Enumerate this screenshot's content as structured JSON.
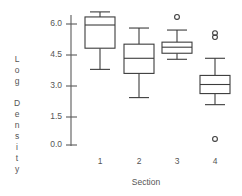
{
  "chart_data": {
    "type": "box",
    "title": "",
    "xlabel": "Section",
    "ylabel": "Log Density",
    "ylabel_lines": [
      "L",
      "o",
      "g",
      "",
      "D",
      "e",
      "n",
      "s",
      "i",
      "t",
      "y"
    ],
    "categories": [
      "1",
      "2",
      "3",
      "4"
    ],
    "ytick_labels": [
      "6.0",
      "4.5",
      "3.0",
      "1.5",
      "0.0"
    ],
    "ytick_values": [
      6.0,
      4.5,
      3.0,
      1.5,
      0.0
    ],
    "ylim": [
      -0.1,
      6.8
    ],
    "grid": false,
    "legend": null,
    "boxes": [
      {
        "category": "1",
        "whisker_low": 3.75,
        "q1": 4.8,
        "median": 5.95,
        "q3": 6.35,
        "whisker_high": 6.6,
        "outliers": []
      },
      {
        "category": "2",
        "whisker_low": 2.35,
        "q1": 3.55,
        "median": 4.3,
        "q3": 5.0,
        "whisker_high": 5.8,
        "outliers": []
      },
      {
        "category": "3",
        "whisker_low": 4.25,
        "q1": 4.55,
        "median": 4.85,
        "q3": 5.1,
        "whisker_high": 5.7,
        "outliers": [
          6.35
        ]
      },
      {
        "category": "4",
        "whisker_low": 2.0,
        "q1": 2.55,
        "median": 3.0,
        "q3": 3.45,
        "whisker_high": 4.3,
        "outliers": [
          5.35,
          5.55,
          0.3
        ]
      }
    ],
    "colors": {
      "background": "#ffffff",
      "line": "#3c3c3c",
      "axis": "#5a5a5a",
      "text": "#555555",
      "box_fill": "#ffffff"
    }
  }
}
